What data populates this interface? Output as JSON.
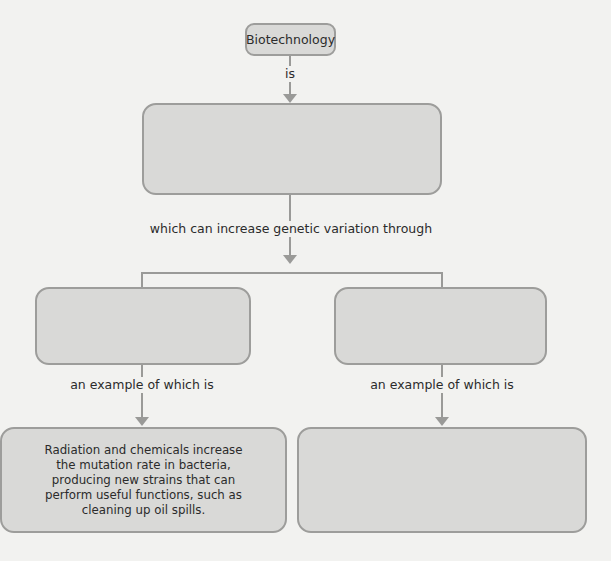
{
  "diagram": {
    "type": "concept-map",
    "root": {
      "label": "Biotechnology"
    },
    "links": {
      "root_to_definition": "is",
      "definition_to_methods": "which can increase genetic variation through",
      "left_method_to_example": "an example of which is",
      "right_method_to_example": "an example of which is"
    },
    "boxes": {
      "definition": "",
      "method_left": "",
      "method_right": "",
      "example_left": "Radiation and chemicals increase the mutation rate in bacteria, producing new strains that can perform useful functions, such as cleaning up oil spills.",
      "example_right": ""
    },
    "colors": {
      "background": "#f2f2f0",
      "box_fill": "#d9d9d7",
      "box_border": "#9d9d9b",
      "connector": "#9a9a98",
      "text": "#2b2b2b"
    }
  }
}
